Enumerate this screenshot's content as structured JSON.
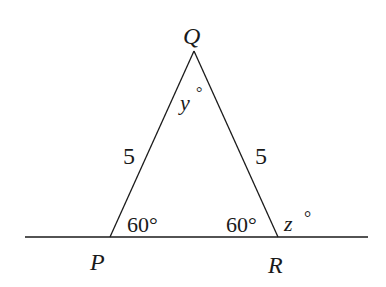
{
  "diagram": {
    "vertices": {
      "P": {
        "label": "P",
        "x": 110,
        "y": 237
      },
      "Q": {
        "label": "Q",
        "x": 194,
        "y": 51
      },
      "R": {
        "label": "R",
        "x": 278,
        "y": 237
      }
    },
    "baseline": {
      "x1": 25,
      "x2": 368,
      "y": 237
    },
    "sides": {
      "PQ": "5",
      "QR": "5"
    },
    "angles": {
      "P": "60°",
      "R": "60°",
      "Q_var": "y",
      "Q_deg": "°",
      "ext_var": "z",
      "ext_deg": "°"
    },
    "colors": {
      "stroke": "#1a1a1a",
      "background": "#ffffff"
    }
  }
}
